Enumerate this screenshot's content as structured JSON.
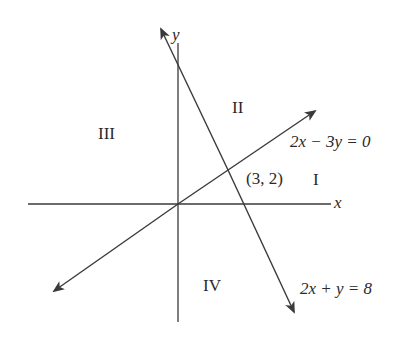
{
  "diagram": {
    "type": "coordinate-plane-linear-system",
    "axes": {
      "x_label": "x",
      "y_label": "y"
    },
    "lines": [
      {
        "id": "line1",
        "equation": "2x − 3y = 0",
        "double_arrow": true
      },
      {
        "id": "line2",
        "equation": "2x + y = 8",
        "double_arrow": true
      }
    ],
    "intersection": {
      "label": "(3, 2)",
      "x": 3,
      "y": 2
    },
    "regions": [
      {
        "id": "region-1",
        "label": "I"
      },
      {
        "id": "region-2",
        "label": "II"
      },
      {
        "id": "region-3",
        "label": "III"
      },
      {
        "id": "region-4",
        "label": "IV"
      }
    ],
    "colors": {
      "stroke": "#3a3a3a",
      "text": "#2a2a2a",
      "background": "#ffffff"
    }
  }
}
